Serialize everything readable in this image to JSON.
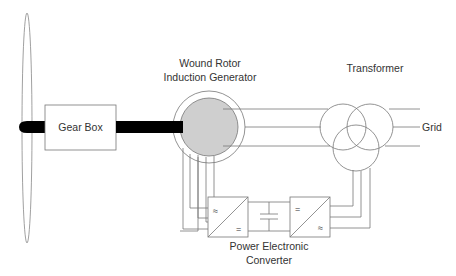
{
  "diagram": {
    "colors": {
      "line": "#777777",
      "shaft": "#000000",
      "rotor_fill": "#cfcfcf",
      "text": "#333333"
    },
    "components": {
      "blade": {
        "label": ""
      },
      "gear_box": {
        "label": "Gear Box"
      },
      "generator": {
        "label_line1": "Wound Rotor",
        "label_line2": "Induction Generator"
      },
      "transformer": {
        "label": "Transformer"
      },
      "grid": {
        "label": "Grid"
      },
      "converter": {
        "label_line1": "Power Electronic",
        "label_line2": "Converter",
        "rotor_side": {
          "ac_symbol": "≈",
          "dc_symbol": "="
        },
        "grid_side": {
          "dc_symbol": "=",
          "ac_symbol": "≈"
        }
      }
    }
  }
}
